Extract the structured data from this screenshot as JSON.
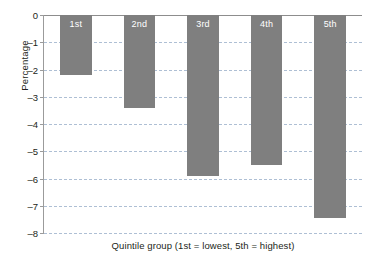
{
  "chart_data": {
    "type": "bar",
    "title": "",
    "subtitle": "",
    "categories": [
      "1st",
      "2nd",
      "3rd",
      "4th",
      "5th"
    ],
    "values": [
      -2.2,
      -3.4,
      -5.9,
      -5.5,
      -7.45
    ],
    "bar_labels": [
      "1st",
      "2nd",
      "3rd",
      "4th",
      "5th"
    ],
    "xlabel": "Quintile group (1st = lowest, 5th = highest)",
    "ylabel": "Percentage",
    "ylim": [
      -8,
      0
    ],
    "yticks": [
      0,
      -1,
      -2,
      -3,
      -4,
      -5,
      -6,
      -7,
      -8
    ],
    "ytick_labels": [
      "0",
      "–1",
      "–2",
      "–3",
      "–4",
      "–5",
      "–6",
      "–7",
      "–8"
    ],
    "grid": true,
    "grid_style": "dashed",
    "legend": "none",
    "orientation": "vertical",
    "colors": {
      "bar": "#7f7f7f",
      "gridline": "#aebfd4",
      "axis": "#9b9b9b",
      "text": "#231f20",
      "bar_label_text": "#ffffff",
      "background": "#ffffff"
    }
  }
}
